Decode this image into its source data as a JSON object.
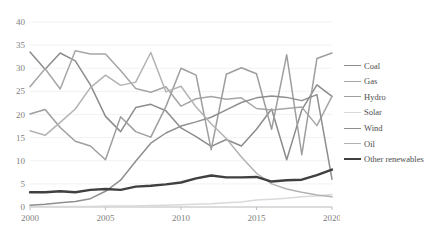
{
  "chart_data": {
    "type": "line",
    "title": "",
    "subtitle": "",
    "xlabel": "",
    "ylabel": "",
    "x": [
      2000,
      2001,
      2002,
      2003,
      2004,
      2005,
      2006,
      2007,
      2008,
      2009,
      2010,
      2011,
      2012,
      2013,
      2014,
      2015,
      2016,
      2017,
      2018,
      2019,
      2020
    ],
    "xlim": [
      2000,
      2020
    ],
    "ylim": [
      0,
      40
    ],
    "xticks": [
      "2000",
      "2005",
      "2010",
      "2015",
      "2020"
    ],
    "yticks": [
      "0",
      "5",
      "10",
      "15",
      "20",
      "25",
      "30",
      "35",
      "40"
    ],
    "grid": "horizontal",
    "legend_position": "right",
    "series": [
      {
        "name": "Coal",
        "color": "#8c8c8c",
        "width": 1.5,
        "values": [
          33.5,
          29.8,
          33.3,
          31.6,
          26.4,
          19.6,
          16.3,
          21.5,
          22.2,
          20.8,
          17.1,
          15.2,
          13.1,
          14.6,
          13.2,
          16.8,
          21.2,
          10.2,
          21.0,
          26.4,
          23.9
        ]
      },
      {
        "name": "Gas",
        "color": "#a6a6a6",
        "width": 1.5,
        "values": [
          26.0,
          29.9,
          25.5,
          33.8,
          33.1,
          33.1,
          29.5,
          25.6,
          24.8,
          26.0,
          21.8,
          23.4,
          23.9,
          23.3,
          23.6,
          21.3,
          21.0,
          21.3,
          21.6,
          17.6,
          23.9
        ]
      },
      {
        "name": "Hydro",
        "color": "#9e9e9e",
        "width": 1.5,
        "values": [
          20.1,
          21.1,
          17.2,
          14.2,
          13.2,
          10.2,
          19.5,
          16.3,
          15.1,
          21.7,
          30.0,
          28.5,
          12.4,
          28.7,
          30.1,
          28.8,
          16.8,
          32.9,
          11.3,
          32.1,
          33.3
        ]
      },
      {
        "name": "Solar",
        "color": "#d9d9d9",
        "width": 1.5,
        "values": [
          0.1,
          0.1,
          0.1,
          0.1,
          0.1,
          0.2,
          0.2,
          0.2,
          0.3,
          0.4,
          0.5,
          0.6,
          0.7,
          0.9,
          1.1,
          1.5,
          1.7,
          1.9,
          2.2,
          2.4,
          2.7
        ]
      },
      {
        "name": "Wind",
        "color": "#8f8f8f",
        "width": 1.5,
        "values": [
          0.4,
          0.6,
          0.9,
          1.2,
          1.8,
          3.4,
          5.8,
          9.9,
          13.8,
          16.0,
          17.5,
          18.4,
          19.4,
          21.0,
          22.6,
          23.6,
          24.0,
          23.7,
          23.0,
          24.3,
          6.0
        ]
      },
      {
        "name": "Oil",
        "color": "#b3b3b3",
        "width": 1.5,
        "values": [
          16.5,
          15.5,
          18.3,
          21.2,
          25.8,
          28.5,
          26.3,
          27.0,
          33.4,
          24.9,
          26.1,
          21.6,
          18.0,
          14.8,
          10.8,
          7.3,
          5.0,
          3.9,
          3.2,
          2.6,
          2.2
        ]
      },
      {
        "name": "Other renewables",
        "color": "#404040",
        "width": 2.4,
        "values": [
          3.2,
          3.2,
          3.4,
          3.2,
          3.7,
          3.9,
          3.7,
          4.4,
          4.6,
          4.9,
          5.3,
          6.2,
          6.8,
          6.4,
          6.4,
          6.5,
          5.5,
          5.8,
          5.9,
          6.9,
          8.1
        ]
      }
    ]
  },
  "legend": {
    "items": [
      {
        "label": "Coal"
      },
      {
        "label": "Gas"
      },
      {
        "label": "Hydro"
      },
      {
        "label": "Solar"
      },
      {
        "label": "Wind"
      },
      {
        "label": "Oil"
      },
      {
        "label": "Other renewables"
      }
    ]
  },
  "axes": {
    "gridline_color": "#f2f2f2",
    "axis_color": "#bfbfbf",
    "tick_label_color": "#808080"
  }
}
